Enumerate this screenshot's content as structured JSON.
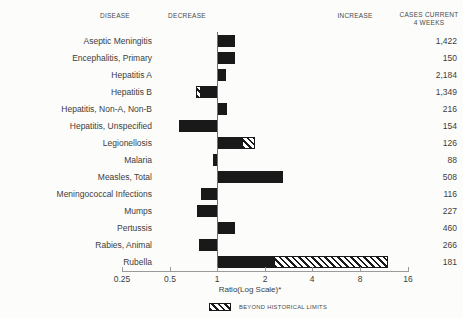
{
  "header": {
    "disease": "DISEASE",
    "decrease": "DECREASE",
    "increase": "INCREASE",
    "cases_line1": "CASES CURRENT",
    "cases_line2": "4 WEEKS"
  },
  "colors": {
    "bar": "#191919",
    "hatch_bg": "#ffffff",
    "axis": "#9a9a9a",
    "text": "#3c3c3c",
    "background": "#fcfcfb"
  },
  "chart_data": {
    "type": "bar",
    "orientation": "horizontal",
    "x_scale": "log2",
    "x_range": [
      0.25,
      16
    ],
    "x_ticks": [
      0.25,
      0.5,
      1,
      2,
      4,
      8,
      16
    ],
    "x_tick_labels": [
      "0.25",
      "0.5",
      "1",
      "2",
      "4",
      "8",
      "16"
    ],
    "xlabel": "Ratio(Log Scale)*",
    "baseline": 1,
    "grid": false,
    "legend": [
      {
        "swatch": "diagonal-hatch",
        "label": "BEYOND HISTORICAL LIMITS"
      }
    ],
    "rows": [
      {
        "disease": "Aseptic Meningitis",
        "cases": "1,422",
        "direction": "increase",
        "solid": [
          1,
          1.3
        ],
        "hatch": null
      },
      {
        "disease": "Encephalitis, Primary",
        "cases": "150",
        "direction": "increase",
        "solid": [
          1,
          1.3
        ],
        "hatch": null
      },
      {
        "disease": "Hepatitis A",
        "cases": "2,184",
        "direction": "increase",
        "solid": [
          1,
          1.13
        ],
        "hatch": null
      },
      {
        "disease": "Hepatitis B",
        "cases": "1,349",
        "direction": "decrease",
        "solid": [
          0.79,
          1
        ],
        "hatch": [
          0.73,
          0.79
        ]
      },
      {
        "disease": "Hepatitis, Non-A, Non-B",
        "cases": "216",
        "direction": "increase",
        "solid": [
          1,
          1.16
        ],
        "hatch": null
      },
      {
        "disease": "Hepatitis, Unspecified",
        "cases": "154",
        "direction": "decrease",
        "solid": [
          0.57,
          1
        ],
        "hatch": null
      },
      {
        "disease": "Legionellosis",
        "cases": "126",
        "direction": "increase",
        "solid": [
          1,
          1.43
        ],
        "hatch": [
          1.43,
          1.73
        ]
      },
      {
        "disease": "Malaria",
        "cases": "88",
        "direction": "decrease",
        "solid": [
          0.94,
          1
        ],
        "hatch": null
      },
      {
        "disease": "Measles, Total",
        "cases": "508",
        "direction": "increase",
        "solid": [
          1,
          2.6
        ],
        "hatch": null
      },
      {
        "disease": "Meningococcal Infections",
        "cases": "116",
        "direction": "decrease",
        "solid": [
          0.79,
          1
        ],
        "hatch": null
      },
      {
        "disease": "Mumps",
        "cases": "227",
        "direction": "decrease",
        "solid": [
          0.74,
          1
        ],
        "hatch": null
      },
      {
        "disease": "Pertussis",
        "cases": "460",
        "direction": "increase",
        "solid": [
          1,
          1.3
        ],
        "hatch": null
      },
      {
        "disease": "Rabies, Animal",
        "cases": "266",
        "direction": "decrease",
        "solid": [
          0.77,
          1
        ],
        "hatch": null
      },
      {
        "disease": "Rubella",
        "cases": "181",
        "direction": "increase",
        "solid": [
          1,
          2.28
        ],
        "hatch": [
          2.28,
          12
        ]
      }
    ]
  }
}
